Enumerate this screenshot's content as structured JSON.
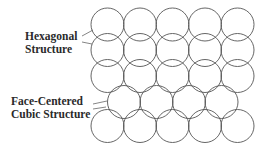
{
  "labels": {
    "hexagonal": {
      "line1": "Hexagonal",
      "line2": "Structure"
    },
    "fcc": {
      "line1": "Face-Centered",
      "line2": "Cubic Structure"
    }
  },
  "diagram": {
    "stroke_color": "#555555",
    "background_color": "#ffffff",
    "circle_radius": 16.5,
    "rows": [
      {
        "row": 1,
        "count": 5,
        "offset": false
      },
      {
        "row": 2,
        "count": 5,
        "offset": false
      },
      {
        "row": 3,
        "count": 5,
        "offset": false
      },
      {
        "row": 4,
        "count": 4,
        "offset": true
      },
      {
        "row": 5,
        "count": 5,
        "offset": false
      }
    ]
  }
}
